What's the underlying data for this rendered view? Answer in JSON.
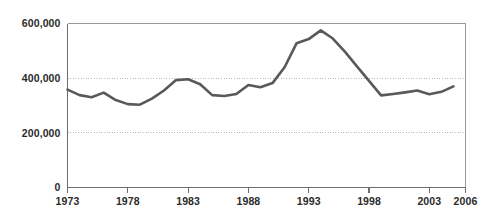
{
  "chart_data": {
    "type": "line",
    "title": "",
    "subtitle": "",
    "xlabel": "",
    "ylabel": "",
    "xlim": [
      1973,
      2006
    ],
    "ylim": [
      0,
      600000
    ],
    "grid": "horizontal-dotted",
    "legend": "none",
    "line_color": "#595959",
    "x": [
      1973,
      1974,
      1975,
      1976,
      1977,
      1978,
      1979,
      1980,
      1981,
      1982,
      1983,
      1984,
      1985,
      1986,
      1987,
      1988,
      1989,
      1990,
      1991,
      1992,
      1993,
      1994,
      1995,
      1996,
      1997,
      1998,
      1999,
      2000,
      2001,
      2002,
      2003,
      2004,
      2005
    ],
    "series": [
      {
        "name": "Series 1",
        "values": [
          358000,
          338000,
          330000,
          347000,
          320000,
          305000,
          303000,
          325000,
          355000,
          393000,
          396000,
          378000,
          338000,
          335000,
          342000,
          375000,
          367000,
          382000,
          440000,
          528000,
          543000,
          575000,
          545000,
          497000,
          443000,
          390000,
          337000,
          342000,
          348000,
          355000,
          341000,
          350000,
          370000
        ]
      }
    ],
    "yticks": [
      0,
      200000,
      400000,
      600000
    ],
    "ytick_labels": [
      "0",
      "200,000",
      "400,000",
      "600,000"
    ],
    "xticks": [
      1973,
      1978,
      1983,
      1988,
      1993,
      1998,
      2003,
      2006
    ],
    "xtick_labels": [
      "1973",
      "1978",
      "1983",
      "1988",
      "1993",
      "1998",
      "2003",
      "2006"
    ]
  }
}
